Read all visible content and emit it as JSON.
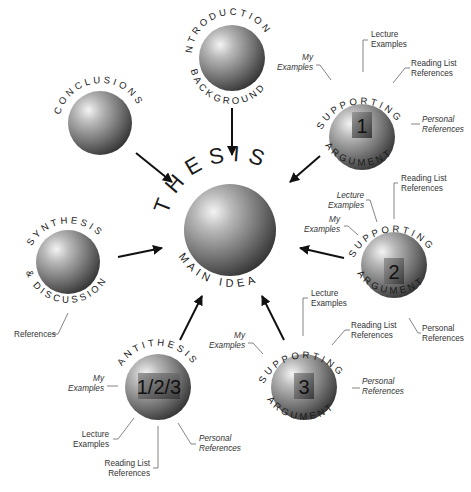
{
  "center": {
    "top": "THESIS",
    "bottom": "MAIN IDEA"
  },
  "intro": {
    "top": "INTRODUCTION",
    "bottom": "BACKGROUND"
  },
  "conclusions": {
    "top": "CONCLUSIONS"
  },
  "synthesis": {
    "top": "SYNTHESIS",
    "bottom": "& DISCUSSION",
    "references": "References"
  },
  "antithesis": {
    "top": "ANTITHESIS",
    "number": "1/2/3",
    "my1": "My",
    "my2": "Examples",
    "lec1": "Lecture",
    "lec2": "Examples",
    "read1": "Reading List",
    "read2": "References",
    "pers1": "Personal",
    "pers2": "References"
  },
  "sa1": {
    "top": "SUPPORTING",
    "bottom": "ARGUMENT",
    "number": "1",
    "my1": "My",
    "my2": "Examples",
    "lec1": "Lecture",
    "lec2": "Examples",
    "read1": "Reading List",
    "read2": "References",
    "pers1": "Personal",
    "pers2": "References"
  },
  "sa2": {
    "top": "SUPPORTING",
    "bottom": "ARGUMENT",
    "number": "2",
    "my1": "My",
    "my2": "Examples",
    "lec1": "Lecture",
    "lec2": "Examples",
    "read1": "Reading List",
    "read2": "References",
    "pers1": "Personal",
    "pers2": "References"
  },
  "sa3": {
    "top": "SUPPORTING",
    "bottom": "ARGUMENT",
    "number": "3",
    "my1": "My",
    "my2": "Examples",
    "lec1": "Lecture",
    "lec2": "Examples",
    "read1": "Reading List",
    "read2": "References",
    "pers1": "Personal",
    "pers2": "References"
  }
}
